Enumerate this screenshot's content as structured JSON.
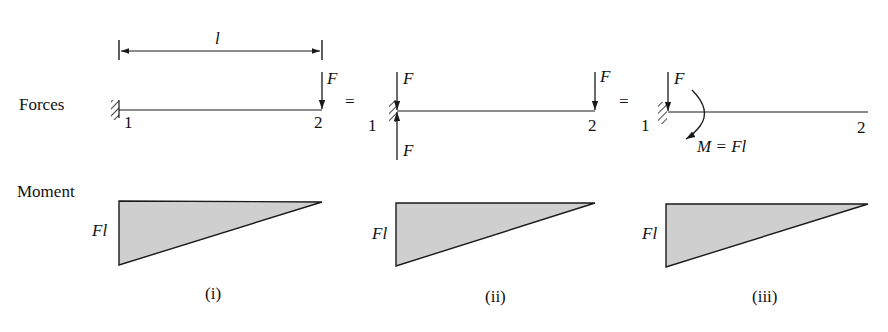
{
  "row_labels": {
    "forces": "Forces",
    "moment": "Moment"
  },
  "dimension": {
    "label": "l"
  },
  "panels": [
    {
      "id": "i",
      "caption": "(i)",
      "node1": "1",
      "node2": "2",
      "forces": [
        {
          "label": "F",
          "at": "node2",
          "direction": "down"
        }
      ],
      "moment_label": "Fl"
    },
    {
      "id": "ii",
      "caption": "(ii)",
      "node1": "1",
      "node2": "2",
      "forces": [
        {
          "label": "F",
          "at": "node1",
          "direction": "down"
        },
        {
          "label": "F",
          "at": "node1",
          "direction": "up"
        },
        {
          "label": "F",
          "at": "node2",
          "direction": "down"
        }
      ],
      "moment_label": "Fl"
    },
    {
      "id": "iii",
      "caption": "(iii)",
      "node1": "1",
      "node2": "2",
      "forces": [
        {
          "label": "F",
          "at": "node1",
          "direction": "down"
        }
      ],
      "couple_label": "M = Fl",
      "moment_label": "Fl"
    }
  ],
  "equals": [
    "=",
    "="
  ],
  "colors": {
    "line": "#1a1a1a",
    "fill": "#cfcfcf"
  }
}
